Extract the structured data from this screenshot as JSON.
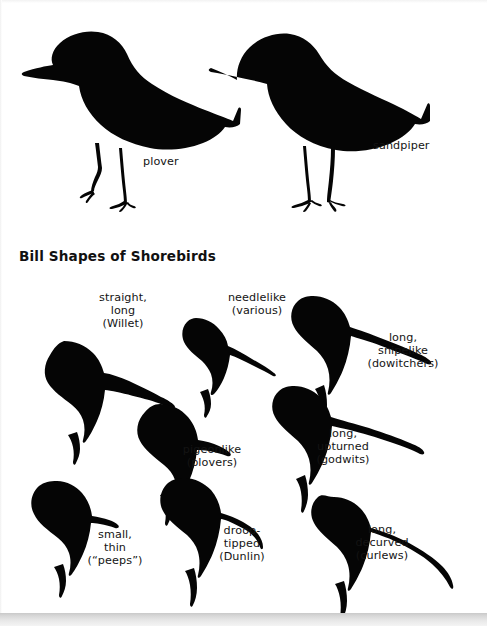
{
  "figure": {
    "title": "Bill Shapes of Shorebirds",
    "background_color": "#ffffff",
    "silhouette_color": "#050505",
    "text_color": "#141414"
  },
  "body_shapes": {
    "section_name": "shorebird-body-silhouettes",
    "birds": [
      {
        "id": "plover",
        "label": "plover"
      },
      {
        "id": "sandpiper",
        "label": "sandpiper"
      }
    ]
  },
  "bill_shapes": {
    "heads": [
      {
        "id": "willet",
        "label": "straight,\nlong\n(Willet)"
      },
      {
        "id": "various",
        "label": "needlelike\n(various)"
      },
      {
        "id": "dowitchers",
        "label": "long,\nsnipelike\n(dowitchers)"
      },
      {
        "id": "plovers",
        "label": "pigeonlike\n(plovers)"
      },
      {
        "id": "godwits",
        "label": "long,\nupturned\n(godwits)"
      },
      {
        "id": "peeps",
        "label": "small,\nthin\n(“peeps”)"
      },
      {
        "id": "dunlin",
        "label": "droop-\ntipped\n(Dunlin)"
      },
      {
        "id": "curlews",
        "label": "long,\ndecurved\n(curlews)"
      }
    ]
  }
}
